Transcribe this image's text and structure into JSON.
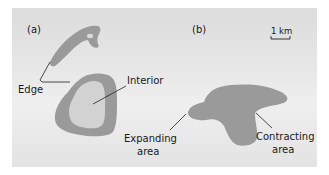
{
  "figure": {
    "panel_a": {
      "label": "(a)",
      "edge_label": "Edge",
      "interior_label": "Interior"
    },
    "panel_b": {
      "label": "(b)",
      "expanding_label_1": "Expanding",
      "expanding_label_2": "area",
      "contracting_label_1": "Contracting",
      "contracting_label_2": "area",
      "scale_label": "1 km"
    },
    "colors": {
      "shape_fill": "#9a9a9a",
      "interior_fill": "#d2d2d2",
      "background": "#e6e6e6",
      "line": "#222222"
    }
  }
}
